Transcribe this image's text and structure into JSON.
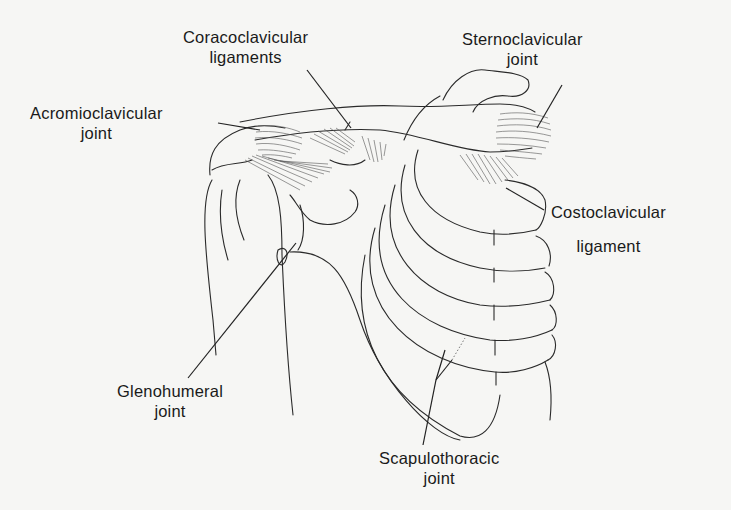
{
  "figure": {
    "background_color": "#f6f6f4",
    "line_color": "#2a2a2a"
  },
  "labels": {
    "coracoclavicular": {
      "line1": "Coracoclavicular",
      "line2": "ligaments"
    },
    "sternoclavicular": {
      "line1": "Sternoclavicular",
      "line2": "joint"
    },
    "acromioclavicular": {
      "line1": "Acromioclavicular",
      "line2": "joint"
    },
    "costoclavicular": {
      "line1": "Costoclavicular",
      "line2": "ligament"
    },
    "glenohumeral": {
      "line1": "Glenohumeral",
      "line2": "joint"
    },
    "scapulothoracic": {
      "line1": "Scapulothoracic",
      "line2": "joint"
    }
  }
}
